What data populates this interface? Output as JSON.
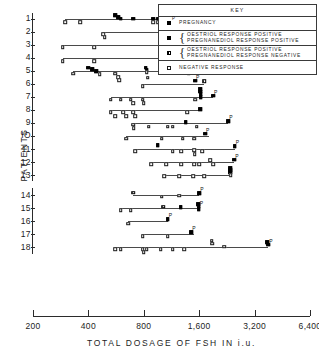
{
  "chart_data": {
    "type": "scatter",
    "title": "",
    "xlabel": "TOTAL  DOSAGE  OF  FSH  IN  i.u.",
    "ylabel": "PATIENTS",
    "x_scale": "log2",
    "xticks": [
      200,
      400,
      800,
      1600,
      3200,
      6400
    ],
    "xtick_labels": [
      "200",
      "400",
      "800",
      "1,600",
      "3,200",
      "6,400"
    ],
    "xlim": [
      200,
      6400
    ],
    "yticks": [
      1,
      2,
      3,
      4,
      5,
      6,
      7,
      8,
      9,
      10,
      11,
      12,
      13,
      14,
      15,
      16,
      17,
      18
    ],
    "ytick_labels": [
      "1",
      "2",
      "3",
      "4",
      "5",
      "6",
      "7",
      "8",
      "9",
      "IO",
      "11",
      "12",
      "13",
      "14",
      "15",
      "16",
      "17",
      "18"
    ],
    "grid": false,
    "legend_position": "top-right",
    "series": [
      {
        "name": "pregnancy",
        "marker": "filled-square-P",
        "label": "PREGNANCY"
      },
      {
        "name": "oestriol-pos-pregnanediol-pos",
        "marker": "filled-square",
        "label_lines": [
          "OESTRIOL  RESPONSE  POSITIVE",
          "PREGNANEDIOL  RESPONSE  POSITIVE"
        ]
      },
      {
        "name": "oestriol-pos-pregnanediol-neg",
        "marker": "half-square",
        "label_lines": [
          "OESTRIOL  RESPONSE  POSITIVE",
          "PREGNANEDIOL  RESPONSE  NEGATIVE"
        ]
      },
      {
        "name": "negative-response",
        "marker": "open-square",
        "label": "NEGATIVE  RESPONSE"
      }
    ],
    "patients": [
      {
        "patient": 1,
        "line": [
          300,
          1500
        ],
        "points": [
          {
            "x": 300,
            "y": 1.28,
            "type": "open"
          },
          {
            "x": 360,
            "y": 1.28,
            "type": "open"
          },
          {
            "x": 560,
            "y": 0.74,
            "type": "filled"
          },
          {
            "x": 580,
            "y": 0.92,
            "type": "filled"
          },
          {
            "x": 600,
            "y": 1.0,
            "type": "filled"
          },
          {
            "x": 700,
            "y": 1.0,
            "type": "filled"
          },
          {
            "x": 900,
            "y": 1.0,
            "type": "filled"
          },
          {
            "x": 950,
            "y": 1.0,
            "type": "filled"
          },
          {
            "x": 900,
            "y": 1.3,
            "type": "open"
          },
          {
            "x": 960,
            "y": 1.3,
            "type": "open"
          },
          {
            "x": 1500,
            "y": 0.95,
            "type": "filled",
            "sup": "P"
          }
        ]
      },
      {
        "patient": 2,
        "line": [
          480,
          1250
        ],
        "points": [
          {
            "x": 480,
            "y": 2.22,
            "type": "open"
          },
          {
            "x": 490,
            "y": 2.42,
            "type": "open"
          },
          {
            "x": 1000,
            "y": 2.28,
            "type": "open"
          },
          {
            "x": 1200,
            "y": 1.88,
            "type": "filled",
            "sup": "P"
          },
          {
            "x": 1300,
            "y": 2.02,
            "type": "filled"
          }
        ]
      },
      {
        "patient": 3,
        "line": [
          290,
          2400
        ],
        "points": [
          {
            "x": 290,
            "y": 3.2,
            "type": "open"
          },
          {
            "x": 430,
            "y": 3.2,
            "type": "open"
          },
          {
            "x": 1450,
            "y": 2.72,
            "type": "filled"
          },
          {
            "x": 1600,
            "y": 2.72,
            "type": "filled"
          },
          {
            "x": 1900,
            "y": 2.3,
            "type": "open"
          },
          {
            "x": 1950,
            "y": 2.55,
            "type": "open"
          },
          {
            "x": 1950,
            "y": 2.78,
            "type": "filled"
          },
          {
            "x": 1950,
            "y": 3.3,
            "type": "open"
          },
          {
            "x": 1980,
            "y": 3.62,
            "type": "open"
          },
          {
            "x": 2400,
            "y": 2.88,
            "type": "filled",
            "sup": "P"
          }
        ]
      },
      {
        "patient": 4,
        "line": [
          290,
          2150
        ],
        "points": [
          {
            "x": 290,
            "y": 4.25,
            "type": "open"
          },
          {
            "x": 430,
            "y": 4.25,
            "type": "open"
          },
          {
            "x": 1650,
            "y": 3.82,
            "type": "half"
          },
          {
            "x": 1800,
            "y": 3.88,
            "type": "half"
          },
          {
            "x": 2050,
            "y": 3.55,
            "type": "filled"
          },
          {
            "x": 2080,
            "y": 3.75,
            "type": "filled"
          },
          {
            "x": 2080,
            "y": 3.95,
            "type": "filled"
          },
          {
            "x": 2150,
            "y": 3.62,
            "type": "filled",
            "sup": "P"
          },
          {
            "x": 2100,
            "y": 4.18,
            "type": "open"
          }
        ]
      },
      {
        "patient": 5,
        "line": [
          330,
          1400
        ],
        "points": [
          {
            "x": 330,
            "y": 5.22,
            "type": "open"
          },
          {
            "x": 400,
            "y": 4.78,
            "type": "filled"
          },
          {
            "x": 420,
            "y": 4.88,
            "type": "filled"
          },
          {
            "x": 440,
            "y": 5.05,
            "type": "filled"
          },
          {
            "x": 460,
            "y": 5.25,
            "type": "open"
          },
          {
            "x": 560,
            "y": 5.22,
            "type": "open"
          },
          {
            "x": 580,
            "y": 5.52,
            "type": "open"
          },
          {
            "x": 590,
            "y": 5.72,
            "type": "open"
          },
          {
            "x": 820,
            "y": 4.78,
            "type": "filled"
          },
          {
            "x": 830,
            "y": 4.95,
            "type": "filled"
          },
          {
            "x": 830,
            "y": 5.12,
            "type": "open"
          },
          {
            "x": 840,
            "y": 5.55,
            "type": "open"
          },
          {
            "x": 1060,
            "y": 4.98,
            "type": "half"
          },
          {
            "x": 1180,
            "y": 4.9,
            "type": "filled",
            "sup": "P"
          },
          {
            "x": 1400,
            "y": 5.22,
            "type": "open"
          }
        ]
      },
      {
        "patient": 6,
        "line": [
          790,
          1700
        ],
        "points": [
          {
            "x": 790,
            "y": 6.18,
            "type": "open"
          },
          {
            "x": 1520,
            "y": 5.78,
            "type": "filled",
            "sup": "P"
          },
          {
            "x": 1700,
            "y": 5.82,
            "type": "half"
          }
        ]
      },
      {
        "patient": 7,
        "line": [
          530,
          1900
        ],
        "points": [
          {
            "x": 530,
            "y": 7.22,
            "type": "open"
          },
          {
            "x": 600,
            "y": 7.22,
            "type": "open"
          },
          {
            "x": 680,
            "y": 7.22,
            "type": "open"
          },
          {
            "x": 700,
            "y": 7.48,
            "type": "open"
          },
          {
            "x": 790,
            "y": 7.22,
            "type": "open"
          },
          {
            "x": 800,
            "y": 7.5,
            "type": "open"
          },
          {
            "x": 1520,
            "y": 7.22,
            "type": "open"
          },
          {
            "x": 1620,
            "y": 6.42,
            "type": "filled"
          },
          {
            "x": 1620,
            "y": 6.6,
            "type": "filled"
          },
          {
            "x": 1630,
            "y": 6.82,
            "type": "filled"
          },
          {
            "x": 1630,
            "y": 7.02,
            "type": "filled"
          },
          {
            "x": 1900,
            "y": 6.92,
            "type": "filled",
            "sup": "P"
          }
        ]
      },
      {
        "patient": 8,
        "line": [
          530,
          1620
        ],
        "points": [
          {
            "x": 530,
            "y": 8.2,
            "type": "open"
          },
          {
            "x": 560,
            "y": 8.48,
            "type": "open"
          },
          {
            "x": 620,
            "y": 8.2,
            "type": "open"
          },
          {
            "x": 640,
            "y": 8.48,
            "type": "open"
          },
          {
            "x": 700,
            "y": 8.2,
            "type": "open"
          },
          {
            "x": 720,
            "y": 8.48,
            "type": "open"
          },
          {
            "x": 1380,
            "y": 8.2,
            "type": "open"
          },
          {
            "x": 1620,
            "y": 7.95,
            "type": "filled"
          }
        ]
      },
      {
        "patient": 9,
        "line": [
          700,
          2300
        ],
        "points": [
          {
            "x": 700,
            "y": 9.15,
            "type": "open"
          },
          {
            "x": 705,
            "y": 9.42,
            "type": "open"
          },
          {
            "x": 850,
            "y": 9.3,
            "type": "open"
          },
          {
            "x": 1080,
            "y": 9.3,
            "type": "open"
          },
          {
            "x": 1150,
            "y": 9.3,
            "type": "open"
          },
          {
            "x": 1350,
            "y": 8.95,
            "type": "filled"
          },
          {
            "x": 1550,
            "y": 9.3,
            "type": "open"
          },
          {
            "x": 2300,
            "y": 8.88,
            "type": "filled",
            "sup": "P"
          }
        ]
      },
      {
        "patient": 10,
        "line": [
          640,
          1800
        ],
        "points": [
          {
            "x": 640,
            "y": 10.2,
            "type": "open"
          },
          {
            "x": 1000,
            "y": 10.2,
            "type": "open"
          },
          {
            "x": 1300,
            "y": 10.2,
            "type": "open"
          },
          {
            "x": 1500,
            "y": 10.2,
            "type": "open"
          },
          {
            "x": 1720,
            "y": 9.82,
            "type": "filled",
            "sup": "P"
          }
        ]
      },
      {
        "patient": 11,
        "line": [
          720,
          2500
        ],
        "points": [
          {
            "x": 720,
            "y": 11.18,
            "type": "open"
          },
          {
            "x": 950,
            "y": 10.72,
            "type": "filled"
          },
          {
            "x": 1150,
            "y": 11.18,
            "type": "open"
          },
          {
            "x": 1280,
            "y": 11.18,
            "type": "open"
          },
          {
            "x": 1500,
            "y": 11.1,
            "type": "open"
          },
          {
            "x": 1510,
            "y": 11.4,
            "type": "open"
          },
          {
            "x": 1660,
            "y": 11.18,
            "type": "open"
          },
          {
            "x": 2500,
            "y": 10.78,
            "type": "filled",
            "sup": "P"
          }
        ]
      },
      {
        "patient": 12,
        "line": [
          880,
          2480
        ],
        "points": [
          {
            "x": 880,
            "y": 12.15,
            "type": "open"
          },
          {
            "x": 1060,
            "y": 12.15,
            "type": "open"
          },
          {
            "x": 1280,
            "y": 12.15,
            "type": "open"
          },
          {
            "x": 1500,
            "y": 12.15,
            "type": "open"
          },
          {
            "x": 1600,
            "y": 12.15,
            "type": "open"
          },
          {
            "x": 1830,
            "y": 11.88,
            "type": "open"
          },
          {
            "x": 1900,
            "y": 12.15,
            "type": "open"
          },
          {
            "x": 2480,
            "y": 11.82,
            "type": "filled",
            "sup": "P"
          }
        ]
      },
      {
        "patient": 13,
        "line": [
          1030,
          2400
        ],
        "points": [
          {
            "x": 1030,
            "y": 13.1,
            "type": "open"
          },
          {
            "x": 1250,
            "y": 13.1,
            "type": "open"
          },
          {
            "x": 1480,
            "y": 13.1,
            "type": "open"
          },
          {
            "x": 1700,
            "y": 13.1,
            "type": "open"
          },
          {
            "x": 2350,
            "y": 12.45,
            "type": "filled"
          },
          {
            "x": 2350,
            "y": 12.62,
            "type": "filled"
          },
          {
            "x": 2360,
            "y": 12.8,
            "type": "filled"
          },
          {
            "x": 2370,
            "y": 13.0,
            "type": "open"
          }
        ]
      },
      {
        "patient": 14,
        "line": [
          700,
          1600
        ],
        "points": [
          {
            "x": 700,
            "y": 13.82,
            "type": "half"
          },
          {
            "x": 1000,
            "y": 14.12,
            "type": "open"
          },
          {
            "x": 1250,
            "y": 14.05,
            "type": "open"
          },
          {
            "x": 1600,
            "y": 13.85,
            "type": "filled",
            "sup": "P"
          }
        ]
      },
      {
        "patient": 15,
        "line": [
          600,
          1620
        ],
        "points": [
          {
            "x": 600,
            "y": 15.15,
            "type": "open"
          },
          {
            "x": 680,
            "y": 15.15,
            "type": "open"
          },
          {
            "x": 1020,
            "y": 14.88,
            "type": "half"
          },
          {
            "x": 1270,
            "y": 14.92,
            "type": "filled"
          },
          {
            "x": 1580,
            "y": 14.68,
            "type": "filled"
          },
          {
            "x": 1590,
            "y": 14.88,
            "type": "filled",
            "sup": "P"
          },
          {
            "x": 1590,
            "y": 15.08,
            "type": "filled"
          }
        ]
      },
      {
        "patient": 16,
        "line": [
          660,
          1080
        ],
        "points": [
          {
            "x": 660,
            "y": 16.2,
            "type": "open"
          },
          {
            "x": 1080,
            "y": 15.82,
            "type": "filled",
            "sup": "P"
          }
        ]
      },
      {
        "patient": 17,
        "line": [
          790,
          1500
        ],
        "points": [
          {
            "x": 790,
            "y": 17.15,
            "type": "open"
          },
          {
            "x": 1080,
            "y": 17.15,
            "type": "open"
          },
          {
            "x": 1450,
            "y": 16.85,
            "type": "filled",
            "sup": "P"
          }
        ]
      },
      {
        "patient": 18,
        "line": [
          560,
          3800
        ],
        "points": [
          {
            "x": 560,
            "y": 18.12,
            "type": "open"
          },
          {
            "x": 600,
            "y": 18.12,
            "type": "open"
          },
          {
            "x": 790,
            "y": 18.12,
            "type": "open"
          },
          {
            "x": 800,
            "y": 18.38,
            "type": "open"
          },
          {
            "x": 830,
            "y": 18.12,
            "type": "open"
          },
          {
            "x": 990,
            "y": 18.12,
            "type": "open"
          },
          {
            "x": 1150,
            "y": 18.12,
            "type": "open"
          },
          {
            "x": 1330,
            "y": 18.12,
            "type": "open"
          },
          {
            "x": 1870,
            "y": 17.5,
            "type": "open"
          },
          {
            "x": 1880,
            "y": 17.72,
            "type": "open"
          },
          {
            "x": 2180,
            "y": 17.95,
            "type": "open"
          },
          {
            "x": 3750,
            "y": 17.6,
            "type": "filled"
          },
          {
            "x": 3800,
            "y": 17.78,
            "type": "filled",
            "sup": "P"
          }
        ]
      }
    ]
  },
  "legend": {
    "title": "KEY",
    "rows": [
      {
        "marker": "filled",
        "sup": "P",
        "lines": [
          "PREGNANCY"
        ],
        "brace": false
      },
      {
        "marker": "filled",
        "sup": "",
        "brace": true,
        "lines": [
          "OESTRIOL   RESPONSE   POSITIVE",
          "PREGNANEDIOL   RESPONSE   POSITIVE"
        ]
      },
      {
        "marker": "half",
        "sup": "",
        "brace": true,
        "lines": [
          "OESTRIOL   RESPONSE   POSITIVE",
          "PREGNANEDIOL   RESPONSE   NEGATIVE"
        ]
      },
      {
        "marker": "open",
        "sup": "",
        "brace": false,
        "lines": [
          "NEGATIVE   RESPONSE"
        ]
      }
    ]
  }
}
